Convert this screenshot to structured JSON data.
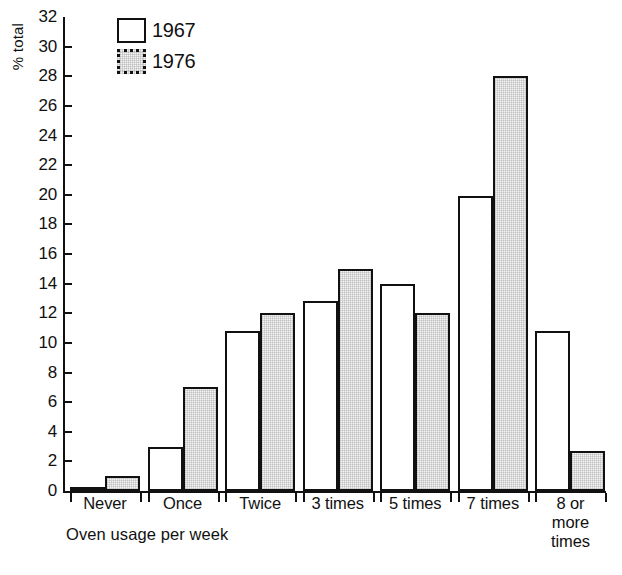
{
  "chart_data": {
    "type": "bar",
    "title": "",
    "xlabel": "Oven usage per week",
    "ylabel": "% total",
    "ylim": [
      0,
      32
    ],
    "ytick_step": 2,
    "yticks": [
      0,
      2,
      4,
      6,
      8,
      10,
      12,
      14,
      16,
      18,
      20,
      22,
      24,
      26,
      28,
      30,
      32
    ],
    "grid": false,
    "legend_position": "top-left",
    "categories": [
      "Never",
      "Once",
      "Twice",
      "3 times",
      "5 times",
      "7 times",
      "8 or\nmore\ntimes"
    ],
    "series": [
      {
        "name": "1967",
        "values": [
          0.2,
          3.0,
          10.8,
          12.8,
          14.0,
          19.9,
          10.8
        ]
      },
      {
        "name": "1976",
        "values": [
          1.0,
          7.0,
          12.0,
          15.0,
          12.0,
          28.0,
          2.7
        ]
      }
    ]
  },
  "legend": {
    "entries": [
      {
        "label": "1967",
        "swatch": "white-square"
      },
      {
        "label": "1976",
        "swatch": "stippled-square"
      }
    ]
  },
  "colors": {
    "ink": "#111111",
    "background": "#ffffff",
    "series_1967_fill": "#ffffff",
    "series_1976_fill": "#f4f4f4"
  }
}
